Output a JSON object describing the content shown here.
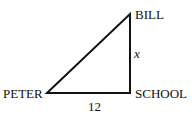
{
  "diagram": {
    "type": "right-triangle",
    "vertices": {
      "top": {
        "label": "BILL",
        "x": 130,
        "y": 14
      },
      "left": {
        "label": "PETER",
        "x": 47,
        "y": 93
      },
      "right_angle": {
        "label": "SCHOOL",
        "x": 130,
        "y": 93
      }
    },
    "sides": {
      "vertical": {
        "label": "x"
      },
      "horizontal": {
        "label": "12"
      }
    },
    "colors": {
      "line": "#111111",
      "background": "#ffffff"
    }
  }
}
